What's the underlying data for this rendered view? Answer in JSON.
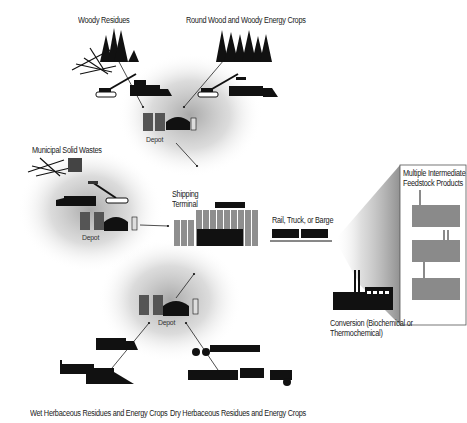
{
  "diagram": {
    "sources": {
      "woody_residues": "Woody Residues",
      "round_wood": "Round Wood and Woody Energy Crops",
      "msw": "Municipal Solid Wastes",
      "wet_herbaceous": "Wet Herbaceous Residues and Energy Crops",
      "dry_herbaceous": "Dry Herbaceous  Residues and Energy Crops"
    },
    "depots": {
      "top": "Depot",
      "left": "Depot",
      "bottom": "Depot"
    },
    "terminal": {
      "line1": "Shipping",
      "line2": "Terminal"
    },
    "transport": "Rail, Truck, or Barge",
    "products_box": {
      "line1": "Multiple Intermediate",
      "line2": "Feedstock Products"
    },
    "conversion": {
      "line1": "Conversion (Biochemical or",
      "line2": "Thermochemical)"
    },
    "colors": {
      "ink": "#111111",
      "factory_gray": "#8a8a8a",
      "halo": "#bdbdbd",
      "box_border": "#555555"
    }
  }
}
